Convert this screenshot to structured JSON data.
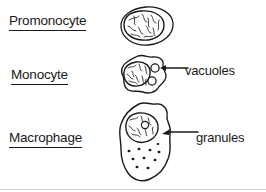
{
  "figure": {
    "background_color": "#ffffff",
    "ink_color": "#1a1a1a",
    "rule_color": "#cfcfcf"
  },
  "rows": [
    {
      "label": "Promonocyte",
      "cell_icon": "promonocyte-cell-icon",
      "has_callout": false
    },
    {
      "label": "Monocyte",
      "cell_icon": "monocyte-cell-icon",
      "has_callout": true,
      "callout": "vacuoles",
      "callout_icon": "leader-line-icon"
    },
    {
      "label": "Macrophage",
      "cell_icon": "macrophage-cell-icon",
      "has_callout": true,
      "callout": "granules",
      "callout_icon": "leader-arrow-icon"
    }
  ]
}
